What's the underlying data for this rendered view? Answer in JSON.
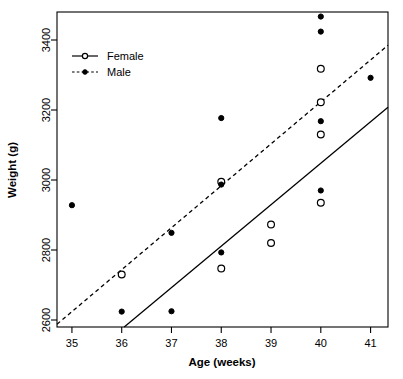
{
  "chart_data": {
    "type": "scatter",
    "title": "",
    "xlabel": "Age (weeks)",
    "ylabel": "Weight (g)",
    "xlim": [
      34.7,
      41.35
    ],
    "ylim": [
      2580,
      3480
    ],
    "xticks": [
      35,
      36,
      37,
      38,
      39,
      40,
      41
    ],
    "xtick_labels": [
      "35",
      "36",
      "37",
      "38",
      "39",
      "40",
      "41"
    ],
    "yticks": [
      2600,
      2800,
      3000,
      3200,
      3400
    ],
    "ytick_labels": [
      "2600",
      "2800",
      "3000",
      "3200",
      "3400"
    ],
    "grid": false,
    "legend_position": "top-left",
    "series": [
      {
        "name": "Female",
        "marker": "open-circle",
        "line_style": "solid",
        "points": [
          {
            "x": 36.0,
            "y": 2730
          },
          {
            "x": 38.0,
            "y": 2995
          },
          {
            "x": 38.0,
            "y": 2747
          },
          {
            "x": 39.0,
            "y": 2873
          },
          {
            "x": 39.0,
            "y": 2820
          },
          {
            "x": 40.0,
            "y": 3318
          },
          {
            "x": 40.0,
            "y": 3222
          },
          {
            "x": 40.0,
            "y": 3130
          },
          {
            "x": 40.0,
            "y": 2935
          }
        ],
        "fit_line": {
          "x1": 36.05,
          "y1": 2580,
          "x2": 41.35,
          "y2": 3208
        }
      },
      {
        "name": "Male",
        "marker": "filled-circle",
        "line_style": "dashed",
        "points": [
          {
            "x": 35.0,
            "y": 2928
          },
          {
            "x": 36.0,
            "y": 2624
          },
          {
            "x": 37.0,
            "y": 2849
          },
          {
            "x": 37.0,
            "y": 2625
          },
          {
            "x": 38.0,
            "y": 3177
          },
          {
            "x": 38.0,
            "y": 2987
          },
          {
            "x": 38.0,
            "y": 2793
          },
          {
            "x": 40.0,
            "y": 3467
          },
          {
            "x": 40.0,
            "y": 3424
          },
          {
            "x": 40.0,
            "y": 3168
          },
          {
            "x": 40.0,
            "y": 2970
          },
          {
            "x": 41.0,
            "y": 3292
          }
        ],
        "fit_line": {
          "x1": 34.7,
          "y1": 2588,
          "x2": 41.35,
          "y2": 3385
        }
      }
    ]
  },
  "legend": {
    "items": [
      {
        "label": "Female",
        "style": "solid-open-circle"
      },
      {
        "label": "Male",
        "style": "dashed-filled-circle"
      }
    ]
  },
  "colors": {
    "foreground": "#000000",
    "background": "#ffffff"
  }
}
